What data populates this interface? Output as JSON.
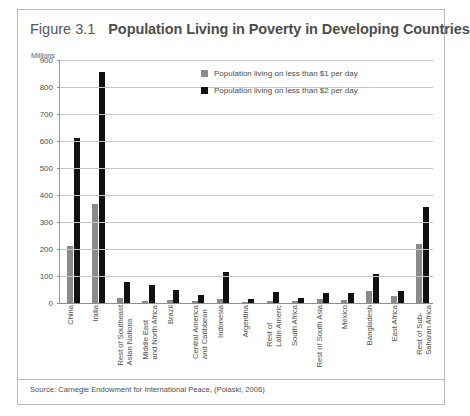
{
  "figure": {
    "number": "Figure 3.1",
    "title": "Population Living in Poverty in Developing Countries",
    "units_label": "Millions",
    "source": "Source: Carnegie Endowment for International Peace, (Polaski, 2006)"
  },
  "colors": {
    "series1": "#8a8a8a",
    "series2": "#111111",
    "frame": "#b9b9b9",
    "gridline": "#c6c6c6",
    "axis": "#8f8f8f",
    "text": "#4e4e4e"
  },
  "chart_data": {
    "type": "bar",
    "title": "Population Living in Poverty in Developing Countries",
    "xlabel": "",
    "ylabel": "Millions",
    "ylim": [
      0,
      900
    ],
    "yticks": [
      0,
      100,
      200,
      300,
      400,
      500,
      600,
      700,
      800,
      900
    ],
    "grid": true,
    "legend_position": "inside-top-center",
    "categories": [
      "China",
      "India",
      "Rest of Southeast\nAsian Nations",
      "Middle East\nand North Africa",
      "Brazil",
      "Central America\nand Caribbean",
      "Indonesia",
      "Argentina",
      "Rest of\nLatin Americ",
      "South Africa",
      "Rest of South Asia",
      "Mexico",
      "Bangladesh",
      "East Africa",
      "Rest of Sub-\nSaharan Africa"
    ],
    "series": [
      {
        "name": "Population living on less than $1 per day",
        "color": "#8a8a8a",
        "values": [
          210,
          365,
          18,
          6,
          10,
          9,
          15,
          5,
          9,
          8,
          14,
          11,
          45,
          25,
          220
        ]
      },
      {
        "name": "Population living on less than $2 per day",
        "color": "#111111",
        "values": [
          610,
          855,
          78,
          68,
          50,
          28,
          115,
          16,
          40,
          18,
          38,
          36,
          108,
          45,
          355
        ]
      }
    ]
  }
}
